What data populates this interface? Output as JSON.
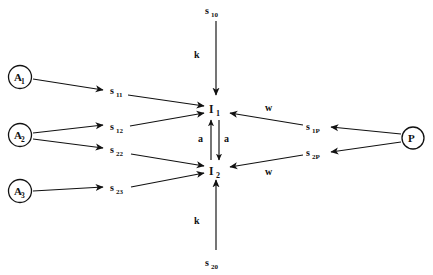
{
  "diagram": {
    "background_color": "#ffffff",
    "stroke_color": "#111111",
    "nodes": {
      "a1": {
        "base": "A",
        "sub": "1"
      },
      "a2": {
        "base": "A",
        "sub": "2"
      },
      "a3": {
        "base": "A",
        "sub": "3"
      },
      "p": {
        "base": "P",
        "sub": ""
      },
      "i1": {
        "base": "I",
        "sub": "1"
      },
      "i2": {
        "base": "I",
        "sub": "2"
      }
    },
    "flux_labels": {
      "s10": {
        "base": "s",
        "sub": "10"
      },
      "s20": {
        "base": "s",
        "sub": "20"
      },
      "s11": {
        "base": "s",
        "sub": "11"
      },
      "s12": {
        "base": "s",
        "sub": "12"
      },
      "s22": {
        "base": "s",
        "sub": "22"
      },
      "s23": {
        "base": "s",
        "sub": "23"
      },
      "s1P": {
        "base": "s",
        "sub": "1P"
      },
      "s2P": {
        "base": "s",
        "sub": "2P"
      }
    },
    "rate_labels": {
      "k_top": "k",
      "k_bottom": "k",
      "a_left": "a",
      "a_right": "a",
      "w_top": "w",
      "w_bottom": "w"
    }
  }
}
